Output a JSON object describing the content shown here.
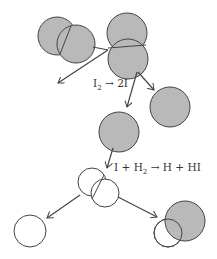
{
  "diagram": {
    "title": "",
    "colors": {
      "iodine_fill": "#b9b9b9",
      "hydrogen_fill": "#ffffff",
      "stroke": "#444444"
    },
    "labels": {
      "reaction1": {
        "lhs": "I",
        "lhs_sub": "2",
        "arrow": "→",
        "rhs": "2I"
      },
      "reaction2": {
        "a": "I",
        "plus1": "+",
        "b": "H",
        "b_sub": "2",
        "arrow": "→",
        "c": "H",
        "plus2": "+",
        "d": "HI"
      }
    },
    "molecules": [
      {
        "id": "incoming-I2",
        "type": "I2"
      },
      {
        "id": "colliding-I2",
        "type": "I2"
      },
      {
        "id": "iodine-atom-1",
        "type": "I"
      },
      {
        "id": "iodine-atom-2",
        "type": "I"
      },
      {
        "id": "H2",
        "type": "H2"
      },
      {
        "id": "hydrogen-atom",
        "type": "H"
      },
      {
        "id": "HI",
        "type": "HI"
      }
    ]
  }
}
